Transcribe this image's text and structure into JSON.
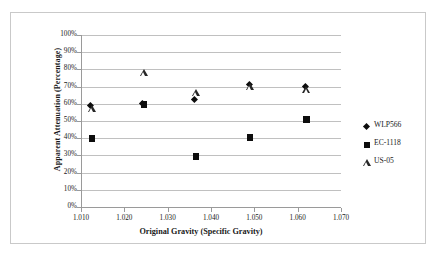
{
  "chart_data": {
    "type": "scatter",
    "title": "",
    "xlabel": "Original Gravity (Specific Gravity)",
    "ylabel": "Apparent Attenuation (Percentage)",
    "xlim": [
      1.01,
      1.07
    ],
    "ylim": [
      0,
      100
    ],
    "xticks": [
      "1.010",
      "1.020",
      "1.030",
      "1.040",
      "1.050",
      "1.060",
      "1.070"
    ],
    "xtick_values": [
      1.01,
      1.02,
      1.03,
      1.04,
      1.05,
      1.06,
      1.07
    ],
    "yticks": [
      "0%",
      "10%",
      "20%",
      "30%",
      "40%",
      "50%",
      "60%",
      "70%",
      "80%",
      "90%",
      "100%"
    ],
    "ytick_values": [
      0,
      10,
      20,
      30,
      40,
      50,
      60,
      70,
      80,
      90,
      100
    ],
    "grid": "horizontal",
    "legend_position": "right",
    "series": [
      {
        "name": "WLP566",
        "marker": "diamond",
        "color": "#0d0d0d",
        "x": [
          1.0125,
          1.0245,
          1.0365,
          1.049,
          1.062
        ],
        "y": [
          58.5,
          59.5,
          62.0,
          70.5,
          69.5
        ]
      },
      {
        "name": "EC-1118",
        "marker": "square",
        "color": "#0d0d0d",
        "x": [
          1.0125,
          1.0245,
          1.0365,
          1.049,
          1.062
        ],
        "y": [
          39.8,
          59.5,
          29.5,
          40.5,
          50.8
        ]
      },
      {
        "name": "US-05",
        "marker": "triangle",
        "color": "#262626",
        "x": [
          1.0125,
          1.0245,
          1.0365,
          1.049,
          1.062
        ],
        "y": [
          53.0,
          74.0,
          62.5,
          66.0,
          64.0
        ]
      }
    ]
  },
  "legend": {
    "items": [
      {
        "label": "WLP566",
        "marker": "diamond"
      },
      {
        "label": "EC-1118",
        "marker": "square"
      },
      {
        "label": "US-05",
        "marker": "triangle"
      }
    ]
  }
}
